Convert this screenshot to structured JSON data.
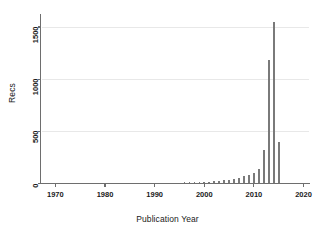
{
  "chart_data": {
    "type": "bar",
    "title": "",
    "subtitle": "",
    "xlabel": "Publication Year",
    "ylabel": "Recs",
    "xlim": [
      1967,
      2021
    ],
    "ylim": [
      0,
      1620
    ],
    "xticks": [
      1970,
      1980,
      1990,
      2000,
      2010,
      2020
    ],
    "xtick_labels": [
      "1970",
      "1980",
      "1990",
      "2000",
      "2010",
      "2020"
    ],
    "yticks": [
      0,
      500,
      1000,
      1500
    ],
    "ytick_labels": [
      "0",
      "500",
      "1000",
      "1500"
    ],
    "grid": true,
    "grid_axis": "y",
    "legend": null,
    "legend_position": "none",
    "bar_color": "#7a7a7a",
    "axis_color": "#6e6e6e",
    "grid_color": "#e8e8e8",
    "text_color": "#1a1a1a",
    "categories": [
      1970,
      1971,
      1972,
      1973,
      1974,
      1975,
      1976,
      1977,
      1978,
      1979,
      1980,
      1981,
      1982,
      1983,
      1984,
      1985,
      1986,
      1987,
      1988,
      1989,
      1990,
      1991,
      1992,
      1993,
      1994,
      1995,
      1996,
      1997,
      1998,
      1999,
      2000,
      2001,
      2002,
      2003,
      2004,
      2005,
      2006,
      2007,
      2008,
      2009,
      2010,
      2011,
      2012,
      2013,
      2014,
      2015,
      2016
    ],
    "values": [
      0,
      0,
      0,
      0,
      0,
      0,
      0,
      0,
      0,
      0,
      0,
      0,
      0,
      0,
      0,
      0,
      0,
      0,
      3,
      4,
      5,
      6,
      5,
      7,
      8,
      9,
      10,
      12,
      11,
      14,
      16,
      18,
      20,
      25,
      30,
      38,
      45,
      55,
      70,
      85,
      105,
      135,
      320,
      1180,
      1550,
      400,
      0
    ]
  }
}
